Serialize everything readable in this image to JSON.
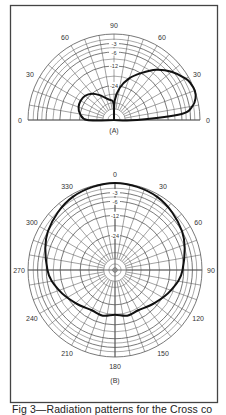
{
  "caption": "Fig 3—Radiation patterns for the Cross co",
  "colors": {
    "grid": "#555555",
    "pattern": "#111111",
    "frame": "#444444",
    "text": "#333333"
  },
  "chart_data": [
    {
      "id": "A",
      "type": "polar-elevation",
      "label": "(A)",
      "title": "Elevation pattern",
      "angle_tick_labels": [
        {
          "angle": 0,
          "text": "0",
          "side": "left"
        },
        {
          "angle": 30,
          "text": "30",
          "side": "left"
        },
        {
          "angle": 60,
          "text": "60",
          "side": "left"
        },
        {
          "angle": 90,
          "text": "90"
        },
        {
          "angle": 60,
          "text": "60",
          "side": "right"
        },
        {
          "angle": 30,
          "text": "30",
          "side": "right"
        },
        {
          "angle": 0,
          "text": "0",
          "side": "right"
        }
      ],
      "db_rings": [
        -3,
        -6,
        -12,
        -24
      ],
      "db_labels": [
        "3",
        "6",
        "12",
        "24"
      ],
      "range_db": [
        -40,
        0
      ],
      "series": [
        {
          "name": "main lobe (right)",
          "points_elev_deg_db": [
            [
              0,
              -30
            ],
            [
              5,
              -6
            ],
            [
              10,
              -2
            ],
            [
              15,
              -0.5
            ],
            [
              20,
              0
            ],
            [
              25,
              -0.3
            ],
            [
              30,
              -1
            ],
            [
              40,
              -3.5
            ],
            [
              50,
              -7
            ],
            [
              60,
              -12
            ],
            [
              70,
              -18
            ],
            [
              80,
              -25
            ],
            [
              88,
              -32
            ]
          ]
        },
        {
          "name": "back lobe (left)",
          "points_elev_deg_db": [
            [
              0,
              -28
            ],
            [
              10,
              -24
            ],
            [
              20,
              -22
            ],
            [
              30,
              -21.5
            ],
            [
              40,
              -22
            ],
            [
              50,
              -24
            ],
            [
              60,
              -27
            ],
            [
              75,
              -31
            ],
            [
              88,
              -33
            ]
          ]
        }
      ]
    },
    {
      "id": "B",
      "type": "polar-azimuth",
      "label": "(B)",
      "title": "Azimuth pattern",
      "angle_tick_labels": [
        "0",
        "30",
        "60",
        "90",
        "120",
        "150",
        "180",
        "210",
        "240",
        "270",
        "300",
        "330"
      ],
      "db_rings": [
        -3,
        -6,
        -12,
        -24
      ],
      "db_labels": [
        "3",
        "6",
        "12",
        "24"
      ],
      "range_db": [
        -40,
        0
      ],
      "series": [
        {
          "name": "azimuth pattern",
          "points_az_deg_db": [
            [
              0,
              0
            ],
            [
              30,
              -0.8
            ],
            [
              60,
              -3
            ],
            [
              90,
              -6.5
            ],
            [
              110,
              -10
            ],
            [
              130,
              -14
            ],
            [
              150,
              -17
            ],
            [
              165,
              -16.5
            ],
            [
              180,
              -18
            ],
            [
              195,
              -16.5
            ],
            [
              210,
              -17
            ],
            [
              230,
              -14
            ],
            [
              250,
              -10
            ],
            [
              270,
              -6.5
            ],
            [
              300,
              -3
            ],
            [
              330,
              -0.8
            ]
          ]
        }
      ]
    }
  ]
}
